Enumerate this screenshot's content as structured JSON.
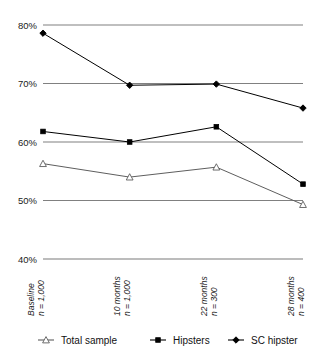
{
  "chart_data": {
    "type": "line",
    "title": "",
    "subtitle": "",
    "xlabel": "",
    "ylabel": "",
    "ylim": [
      40,
      80
    ],
    "ytick_values": [
      40,
      50,
      60,
      70,
      80
    ],
    "ytick_labels": [
      "40%",
      "50%",
      "60%",
      "70%",
      "80%"
    ],
    "grid": true,
    "legend_position": "bottom",
    "categories": [
      "Baseline\nn = 1,000",
      "10 months\nn = 1,000",
      "22 months\nn = 300",
      "28 months\nn = 400"
    ],
    "category_lines": [
      {
        "period": "Baseline",
        "n": "n = 1,000"
      },
      {
        "period": "10 months",
        "n": "n = 1,000"
      },
      {
        "period": "22 months",
        "n": "n = 300"
      },
      {
        "period": "28 months",
        "n": "n = 400"
      }
    ],
    "series": [
      {
        "name": "Total sample",
        "marker": "triangle-open",
        "color": "#5e5e5e",
        "values": [
          56.3,
          54.0,
          55.7,
          49.3
        ]
      },
      {
        "name": "Hipsters",
        "marker": "square",
        "color": "#000000",
        "values": [
          61.8,
          60.0,
          62.6,
          52.8
        ]
      },
      {
        "name": "SC hipster",
        "marker": "diamond",
        "color": "#000000",
        "values": [
          78.6,
          69.7,
          69.9,
          65.8
        ]
      }
    ]
  },
  "legend": {
    "items": [
      {
        "label": "Total sample",
        "marker": "triangle-open",
        "color": "#5e5e5e"
      },
      {
        "label": "Hipsters",
        "marker": "square",
        "color": "#000000"
      },
      {
        "label": "SC hipster",
        "marker": "diamond",
        "color": "#000000"
      }
    ]
  },
  "axis": {
    "y_tick_0": "40%",
    "y_tick_1": "50%",
    "y_tick_2": "60%",
    "y_tick_3": "70%",
    "y_tick_4": "80%"
  },
  "xaxis": {
    "cat_0_period": "Baseline",
    "cat_0_n": "n = 1,000",
    "cat_1_period": "10 months",
    "cat_1_n": "n = 1,000",
    "cat_2_period": "22 months",
    "cat_2_n": "n = 300",
    "cat_3_period": "28 months",
    "cat_3_n": "n = 400"
  }
}
